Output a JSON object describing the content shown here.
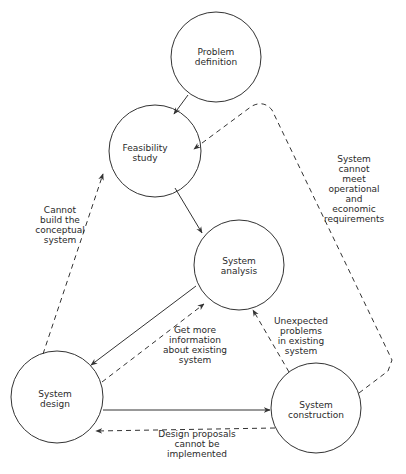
{
  "diagram": {
    "colors": {
      "line": "#333333",
      "text": "#2a2a2a",
      "background": "#ffffff"
    },
    "nodes": [
      {
        "id": "problem-definition",
        "label": "Problem\ndefinition",
        "cx": 216,
        "cy": 57,
        "r": 45
      },
      {
        "id": "feasibility-study",
        "label": "Feasibility\nstudy",
        "cx": 155,
        "cy": 151,
        "r": 46
      },
      {
        "id": "system-analysis",
        "label": "System\nanalysis",
        "cx": 239,
        "cy": 265,
        "r": 45
      },
      {
        "id": "system-design",
        "label": "System\ndesign",
        "cx": 57,
        "cy": 397,
        "r": 46
      },
      {
        "id": "system-construction",
        "label": "System\nconstruction",
        "cx": 316,
        "cy": 408,
        "r": 45
      }
    ],
    "edges": [
      {
        "from": "problem-definition",
        "to": "feasibility-study",
        "style": "solid"
      },
      {
        "from": "feasibility-study",
        "to": "system-analysis",
        "style": "solid"
      },
      {
        "from": "system-analysis",
        "to": "system-design",
        "style": "solid"
      },
      {
        "from": "system-design",
        "to": "system-construction",
        "style": "solid"
      },
      {
        "from": "system-design",
        "to": "feasibility-study",
        "style": "dashed",
        "label": "Cannot\nbuild the\nconceptual\nsystem"
      },
      {
        "from": "system-design",
        "to": "system-analysis",
        "style": "dashed",
        "label": "Get more\ninformation\nabout existing\nsystem"
      },
      {
        "from": "system-construction",
        "to": "system-analysis",
        "style": "dashed",
        "label": "Unexpected\nproblems\nin existing\nsystem"
      },
      {
        "from": "system-construction",
        "to": "system-design",
        "style": "dashed",
        "label": "Design proposals\ncannot be\nimplemented"
      },
      {
        "from": "system-construction",
        "to": "feasibility-study",
        "style": "dashed",
        "label": "System cannot\nmeet operational\nand economic\nrequirements"
      }
    ],
    "edge_labels": {
      "cannot_build": "Cannot\nbuild the\nconceptual\nsystem",
      "get_more_info": "Get more\ninformation\nabout existing\nsystem",
      "unexpected_problems": "Unexpected\nproblems\nin existing\nsystem",
      "design_proposals": "Design proposals\ncannot be\nimplemented",
      "cannot_meet": "System cannot\nmeet operational\nand economic\nrequirements"
    },
    "node_labels": {
      "problem_definition": "Problem\ndefinition",
      "feasibility_study": "Feasibility\nstudy",
      "system_analysis": "System\nanalysis",
      "system_design": "System\ndesign",
      "system_construction": "System\nconstruction"
    }
  }
}
